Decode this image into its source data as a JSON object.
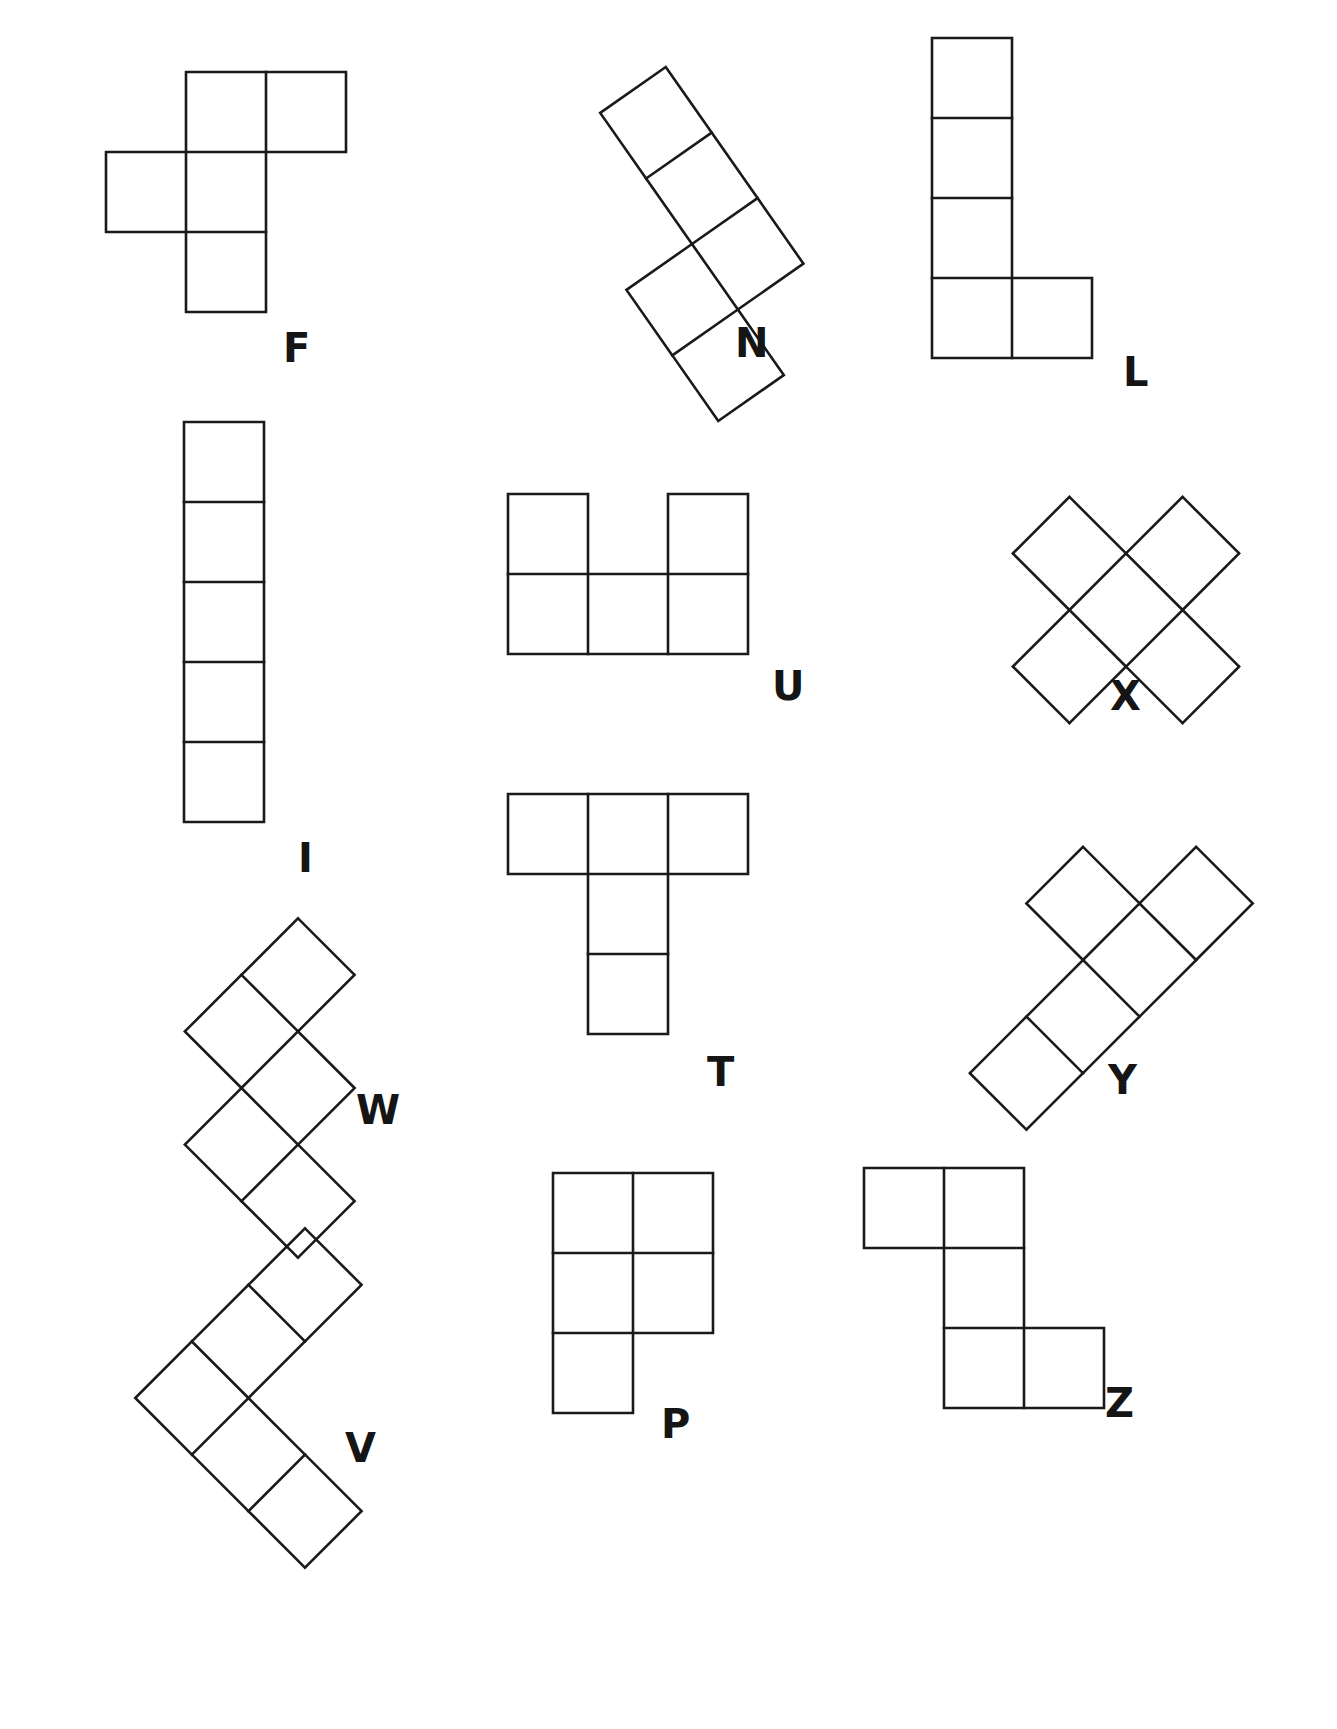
{
  "page": {
    "background_color": "#ffffff",
    "stroke_color": "#1a1a1a",
    "label_color": "#151515",
    "stroke_width": 2.6,
    "width": 1337,
    "height": 1729
  },
  "pieces": [
    {
      "id": "F",
      "label": "F",
      "label_x": 283,
      "label_y": 328,
      "cell": 80,
      "origin_x": 106,
      "origin_y": 72,
      "rotation": 0,
      "cells": [
        [
          1,
          0
        ],
        [
          2,
          0
        ],
        [
          0,
          1
        ],
        [
          1,
          1
        ],
        [
          1,
          2
        ]
      ]
    },
    {
      "id": "N",
      "label": "N",
      "label_x": 735,
      "label_y": 323,
      "cell": 80,
      "origin_x": 612,
      "origin_y": 84,
      "rotation": -35,
      "cells": [
        [
          1,
          0
        ],
        [
          1,
          1
        ],
        [
          0,
          2
        ],
        [
          1,
          2
        ],
        [
          0,
          3
        ]
      ]
    },
    {
      "id": "L",
      "label": "L",
      "label_x": 1123,
      "label_y": 352,
      "cell": 80,
      "origin_x": 932,
      "origin_y": 38,
      "rotation": 0,
      "cells": [
        [
          0,
          0
        ],
        [
          0,
          1
        ],
        [
          0,
          2
        ],
        [
          0,
          3
        ],
        [
          1,
          3
        ]
      ]
    },
    {
      "id": "I",
      "label": "I",
      "label_x": 298,
      "label_y": 838,
      "cell": 80,
      "origin_x": 184,
      "origin_y": 422,
      "rotation": 0,
      "cells": [
        [
          0,
          0
        ],
        [
          0,
          1
        ],
        [
          0,
          2
        ],
        [
          0,
          3
        ],
        [
          0,
          4
        ]
      ]
    },
    {
      "id": "U",
      "label": "U",
      "label_x": 772,
      "label_y": 666,
      "cell": 80,
      "origin_x": 508,
      "origin_y": 494,
      "rotation": 0,
      "cells": [
        [
          0,
          0
        ],
        [
          2,
          0
        ],
        [
          0,
          1
        ],
        [
          1,
          1
        ],
        [
          2,
          1
        ]
      ]
    },
    {
      "id": "X",
      "label": "X",
      "label_x": 1110,
      "label_y": 676,
      "cell": 80,
      "origin_x": 1006,
      "origin_y": 490,
      "rotation": 45,
      "cells": [
        [
          1,
          0
        ],
        [
          0,
          1
        ],
        [
          1,
          1
        ],
        [
          2,
          1
        ],
        [
          1,
          2
        ]
      ]
    },
    {
      "id": "W",
      "label": "W",
      "label_x": 356,
      "label_y": 1090,
      "cell": 80,
      "origin_x": 178,
      "origin_y": 968,
      "rotation": 45,
      "cells": [
        [
          0,
          0
        ],
        [
          0,
          1
        ],
        [
          1,
          1
        ],
        [
          1,
          2
        ],
        [
          2,
          2
        ]
      ]
    },
    {
      "id": "T",
      "label": "T",
      "label_x": 707,
      "label_y": 1052,
      "cell": 80,
      "origin_x": 508,
      "origin_y": 794,
      "rotation": 0,
      "cells": [
        [
          0,
          0
        ],
        [
          1,
          0
        ],
        [
          2,
          0
        ],
        [
          1,
          1
        ],
        [
          1,
          2
        ]
      ]
    },
    {
      "id": "Y",
      "label": "Y",
      "label_x": 1108,
      "label_y": 1060,
      "cell": 80,
      "origin_x": 1003,
      "origin_y": 800,
      "rotation": 45,
      "cells": [
        [
          1,
          0
        ],
        [
          0,
          1
        ],
        [
          1,
          1
        ],
        [
          1,
          2
        ],
        [
          1,
          3
        ]
      ]
    },
    {
      "id": "V",
      "label": "V",
      "label_x": 345,
      "label_y": 1428,
      "cell": 80,
      "origin_x": 185,
      "origin_y": 1278,
      "rotation": 45,
      "cells": [
        [
          0,
          0
        ],
        [
          0,
          1
        ],
        [
          0,
          2
        ],
        [
          1,
          2
        ],
        [
          2,
          2
        ]
      ]
    },
    {
      "id": "P",
      "label": "P",
      "label_x": 661,
      "label_y": 1404,
      "cell": 80,
      "origin_x": 553,
      "origin_y": 1173,
      "rotation": 0,
      "cells": [
        [
          0,
          0
        ],
        [
          1,
          0
        ],
        [
          0,
          1
        ],
        [
          1,
          1
        ],
        [
          0,
          2
        ]
      ]
    },
    {
      "id": "Z",
      "label": "Z",
      "label_x": 1105,
      "label_y": 1383,
      "cell": 80,
      "origin_x": 864,
      "origin_y": 1168,
      "rotation": 0,
      "cells": [
        [
          0,
          0
        ],
        [
          1,
          0
        ],
        [
          1,
          1
        ],
        [
          1,
          2
        ],
        [
          2,
          2
        ]
      ]
    }
  ]
}
